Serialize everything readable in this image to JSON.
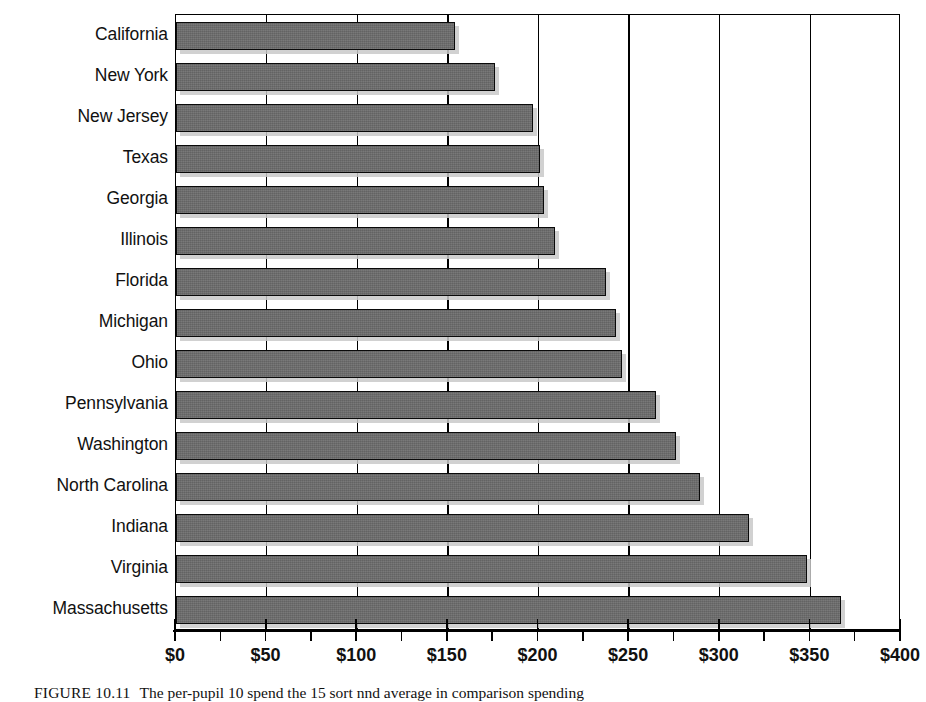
{
  "chart_data": {
    "type": "bar",
    "orientation": "horizontal",
    "title": "",
    "subtitle": "",
    "xlabel": "",
    "ylabel": "",
    "xlim": [
      0,
      400
    ],
    "ylim": null,
    "grid": "vertical-major-only",
    "legend": null,
    "legend_position": "none",
    "bar_color": "#6b6b6b",
    "bar_border_color": "#0a0a0a",
    "axis_color": "#000000",
    "gridline_color": "#000000",
    "background_color": "#ffffff",
    "x_tick_interval": 50,
    "x_minor_tick_interval": 25,
    "x_tick_prefix": "$",
    "categories": [
      "California",
      "New York",
      "New Jersey",
      "Texas",
      "Georgia",
      "Illinois",
      "Florida",
      "Michigan",
      "Ohio",
      "Pennsylvania",
      "Washington",
      "North Carolina",
      "Indiana",
      "Virginia",
      "Massachusetts"
    ],
    "values": [
      154,
      176,
      197,
      201,
      203,
      209,
      237,
      243,
      246,
      265,
      276,
      289,
      316,
      348,
      367
    ],
    "x_tick_values": [
      0,
      50,
      100,
      150,
      200,
      250,
      300,
      350,
      400
    ],
    "x_tick_labels": [
      "$0",
      "$50",
      "$100",
      "$150",
      "$200",
      "$250",
      "$300",
      "$350",
      "$400"
    ],
    "gridline_values": [
      50,
      100,
      150,
      200,
      250,
      300,
      350
    ]
  },
  "caption": {
    "label": "FIGURE 10.11",
    "text": "The per-pupil 10 spend the 15 sort nnd average in comparison spending"
  }
}
